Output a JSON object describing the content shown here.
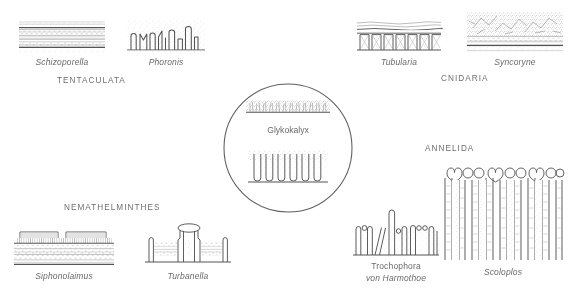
{
  "figure": {
    "center": {
      "label": "Glykokalyx",
      "top_panel_name": "microvilli-with-glycocalyx-fuzz",
      "bottom_panel_name": "microvilli-cross-section"
    },
    "taxa": [
      {
        "id": "tentaculata",
        "label": "TENTACULATA"
      },
      {
        "id": "cnidaria",
        "label": "CNIDARIA"
      },
      {
        "id": "annelida",
        "label": "ANNELIDA"
      },
      {
        "id": "nemathelminthes",
        "label": "NEMATHELMINTHES"
      }
    ],
    "specimens": [
      {
        "id": "schizoporella",
        "caption": "Schizoporella",
        "taxon": "tentaculata",
        "style": "italic"
      },
      {
        "id": "phoronis",
        "caption": "Phoronis",
        "taxon": "tentaculata",
        "style": "italic"
      },
      {
        "id": "tubularia",
        "caption": "Tubularia",
        "taxon": "cnidaria",
        "style": "italic"
      },
      {
        "id": "syncoryne",
        "caption": "Syncoryne",
        "taxon": "cnidaria",
        "style": "italic"
      },
      {
        "id": "scoloplos",
        "caption": "Scoloplos",
        "taxon": "annelida",
        "style": "italic"
      },
      {
        "id": "trochophora",
        "caption_line1": "Trochophora",
        "caption_line2": "von Harmothoe",
        "taxon": "annelida",
        "style": "mixed"
      },
      {
        "id": "siphonolaimus",
        "caption": "Siphonolaimus",
        "taxon": "nemathelminthes",
        "style": "italic"
      },
      {
        "id": "turbanella",
        "caption": "Turbanella",
        "taxon": "nemathelminthes",
        "style": "italic"
      }
    ],
    "colors": {
      "background": "#ffffff",
      "line": "#545454",
      "text": "#6b6b6b",
      "stipple": "#8a8a8a"
    }
  }
}
